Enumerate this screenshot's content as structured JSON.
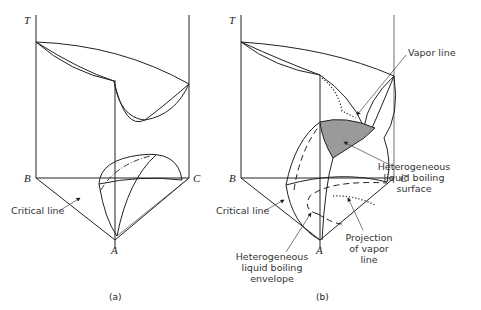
{
  "figure": {
    "panels": [
      {
        "id": "a",
        "caption": "(a)",
        "axis_labels": {
          "T": "T",
          "B": "B",
          "C": "C",
          "A": "A"
        },
        "annotations": [
          {
            "text": "Critical line"
          }
        ]
      },
      {
        "id": "b",
        "caption": "(b)",
        "axis_labels": {
          "T": "T",
          "B": "B",
          "C": "C",
          "A": "A"
        },
        "annotations": [
          {
            "text": "Vapor line"
          },
          {
            "lines": [
              "Heterogeneous",
              "liquid boiling",
              "surface"
            ]
          },
          {
            "text": "Critical line"
          },
          {
            "lines": [
              "Heterogeneous",
              "liquid boiling",
              "envelope"
            ]
          },
          {
            "lines": [
              "Projection",
              "of vapor",
              "line"
            ]
          }
        ]
      }
    ],
    "colors": {
      "line": "#222222",
      "shaded_surface": "#9a9a9a"
    }
  }
}
